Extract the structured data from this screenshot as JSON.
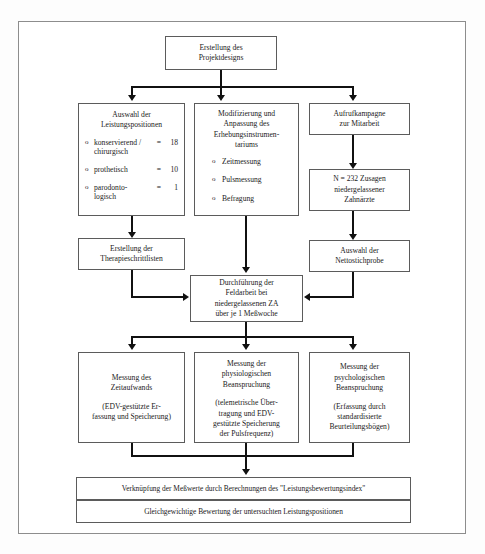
{
  "diagram": {
    "title_box": {
      "text": "Erstellung des\nProjektdesigns"
    },
    "stage2": {
      "left": {
        "title": "Auswahl der\nLeistungspositionen",
        "items": [
          {
            "bullet": "o",
            "label": "konservierend /\nchirurgisch",
            "eq": "=",
            "value": "18"
          },
          {
            "bullet": "o",
            "label": "prothetisch",
            "eq": "=",
            "value": "10"
          },
          {
            "bullet": "o",
            "label": "parodonto-\nlogisch",
            "eq": "=",
            "value": "1"
          }
        ]
      },
      "middle": {
        "title": "Modifizierung und\nAnpassung des\nErhebungsinstrumen-\ntariums",
        "items": [
          {
            "bullet": "o",
            "label": "Zeitmessung"
          },
          {
            "bullet": "o",
            "label": "Pulsmessung"
          },
          {
            "bullet": "o",
            "label": "Befragung"
          }
        ]
      },
      "right": {
        "title": "Aufrufkampagne\nzur Mitarbeit"
      }
    },
    "stage3": {
      "left": {
        "text": "Erstellung der\nTherapieschrittlisten"
      },
      "right": {
        "text": "N = 232 Zusagen\nniedergelassener\nZahnärzte"
      }
    },
    "stage4": {
      "right": {
        "text": "Auswahl der\nNettostichprobe"
      }
    },
    "fieldwork": {
      "text": "Durchführung der\nFeldarbeit bei\nniedergelassenen  ZA\nüber je 1 Meßwoche"
    },
    "measures": {
      "left": {
        "title": "Messung des\nZeitaufwands",
        "sub": "(EDV-gestützte Er-\nfassung und Speicherung)"
      },
      "middle": {
        "title": "Messung der\nphysiologischen\nBeanspruchung",
        "sub": "(telemetrische Über-\ntragung und EDV-\ngestützte Speicherung\nder Pulsfrequenz)"
      },
      "right": {
        "title": "Messung der\npsychologischen\nBeanspruchung",
        "sub": "(Erfassung durch\nstandardisierte\nBeurteilungsbögen)"
      }
    },
    "conclusions": {
      "bar1": "Verknüpfung der Meßwerte durch Berechnungen des \"Leistungsbewertungsindex\"",
      "bar2": "Gleichgewichtige Bewertung der untersuchten Leistungspositionen"
    },
    "colors": {
      "frame": "#8d8d8d",
      "box_border": "#5b5b5b",
      "connector": "#111111",
      "background": "#ffffff",
      "text": "#1a1a1a"
    }
  }
}
